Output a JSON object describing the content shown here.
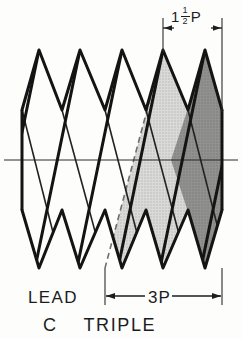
{
  "figure": {
    "title": "C TRIPLE",
    "colors": {
      "line": "#1c1c1c",
      "thin_line": "#3a3a3a",
      "shade_light": "#d2d2d0",
      "shade_dark": "#8d8d8b",
      "background": "#fdfdfc"
    }
  },
  "dimensions": {
    "pitch_label": {
      "whole": "1",
      "fraction_numerator": "1",
      "fraction_denominator": "2",
      "unit": "P",
      "name": "one and one half pitch"
    },
    "lead_label": "LEAD",
    "lead_span_label": "3P"
  },
  "caption": {
    "prefix": "C",
    "text": "TRIPLE"
  },
  "geometry": {
    "crest_y": 50,
    "root_y": 268,
    "axis_y": 160,
    "left_edge_x": 22,
    "right_edge_x": 222,
    "pitch_px": 40,
    "crest_peaks_x": [
      39,
      80,
      122,
      163,
      205
    ],
    "root_valleys_x": [
      22,
      62,
      105,
      146,
      188,
      222
    ],
    "shade_light_start_x": 146,
    "shade_dark_start_x": 188,
    "dash_line": {
      "x1": 163,
      "y1": 50,
      "x2": 105,
      "y2": 268
    }
  }
}
